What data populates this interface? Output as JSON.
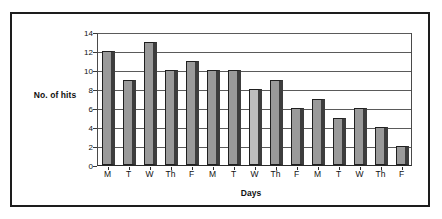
{
  "chart_data": {
    "type": "bar",
    "title": "",
    "xlabel": "Days",
    "ylabel": "No. of hits",
    "categories": [
      "M",
      "T",
      "W",
      "Th",
      "F",
      "M",
      "T",
      "W",
      "Th",
      "F",
      "M",
      "T",
      "W",
      "Th",
      "F"
    ],
    "values": [
      12,
      9,
      13,
      10,
      11,
      10,
      10,
      8,
      9,
      6,
      7,
      5,
      6,
      4,
      2
    ],
    "ylim": [
      0,
      14
    ],
    "yticks": [
      0,
      2,
      4,
      6,
      8,
      10,
      12,
      14
    ],
    "ytick_labels": [
      "0",
      "2",
      "4",
      "6",
      "8",
      "10",
      "12",
      "14"
    ],
    "grid": true,
    "grid_axis": "y",
    "legend": false,
    "bar_color": "#9a9a9a",
    "bar_edge_color": "#1f1f1f",
    "bar_shadow_color": "#3d3d3d",
    "highlight_index": 7,
    "highlight_color": "#bdbdbd",
    "frame_color": "#1d1d1d",
    "background": "#ffffff"
  }
}
